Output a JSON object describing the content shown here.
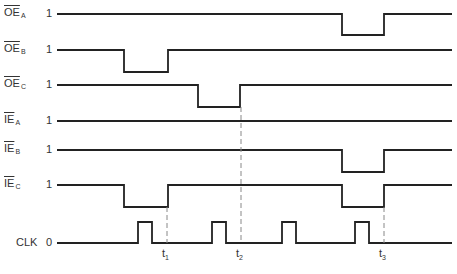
{
  "signals": [
    {
      "id": "oe_a",
      "name": "OE",
      "sub": "A",
      "overbar": true,
      "level": "1",
      "y_high": 14,
      "y_low": 35,
      "pulses": [
        [
          342,
          384
        ]
      ]
    },
    {
      "id": "oe_b",
      "name": "OE",
      "sub": "B",
      "overbar": true,
      "level": "1",
      "y_high": 50,
      "y_low": 72,
      "pulses": [
        [
          124,
          168
        ]
      ]
    },
    {
      "id": "oe_c",
      "name": "OE",
      "sub": "C",
      "overbar": true,
      "level": "1",
      "y_high": 85,
      "y_low": 107,
      "pulses": [
        [
          198,
          240
        ]
      ]
    },
    {
      "id": "ie_a",
      "name": "IE",
      "sub": "A",
      "overbar": true,
      "level": "1",
      "y_high": 121,
      "y_low": 143,
      "pulses": []
    },
    {
      "id": "ie_b",
      "name": "IE",
      "sub": "B",
      "overbar": true,
      "level": "1",
      "y_high": 150,
      "y_low": 172,
      "pulses": [
        [
          342,
          384
        ]
      ]
    },
    {
      "id": "ie_c",
      "name": "IE",
      "sub": "C",
      "overbar": true,
      "level": "1",
      "y_high": 185,
      "y_low": 207,
      "pulses": [
        [
          124,
          168
        ],
        [
          342,
          384
        ]
      ]
    }
  ],
  "clock": {
    "name": "CLK",
    "level": "0",
    "y_low": 243,
    "y_high": 222,
    "pulses": [
      [
        138,
        152
      ],
      [
        212,
        226
      ],
      [
        282,
        296
      ],
      [
        355,
        369
      ]
    ]
  },
  "time_markers": [
    {
      "label": "t",
      "sub": "1",
      "x": 167,
      "y_start": 207
    },
    {
      "label": "t",
      "sub": "2",
      "x": 241,
      "y_start": 107
    },
    {
      "label": "t",
      "sub": "3",
      "x": 384,
      "y_start": 207
    }
  ],
  "x_start": 57,
  "x_end": 452,
  "colors": {
    "line": "#222222",
    "dash": "#888888",
    "text": "#333333"
  }
}
